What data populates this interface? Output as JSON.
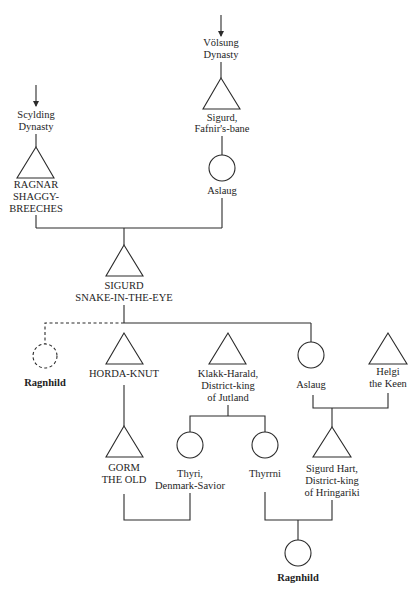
{
  "diagram": {
    "type": "genealogy-tree",
    "legend_implied": {
      "triangle": "male",
      "circle": "female",
      "dashed": "uncertain"
    },
    "ancestry": {
      "volsung": {
        "label_1": "Völsung",
        "label_2": "Dynasty"
      },
      "scylding": {
        "label_1": "Scylding",
        "label_2": "Dynasty"
      }
    },
    "people": {
      "sigurd_fafnir": {
        "label_1": "Sigurd,",
        "label_2": "Fafnir's-bane",
        "sex": "male"
      },
      "aslaug_1": {
        "label_1": "Aslaug",
        "sex": "female"
      },
      "ragnar": {
        "label_1": "RAGNAR",
        "label_2": "SHAGGY-",
        "label_3": "BREECHES",
        "sex": "male"
      },
      "sigurd_snake": {
        "label_1": "SIGURD",
        "label_2": "SNAKE-IN-THE-EYE",
        "sex": "male"
      },
      "ragnhild_1": {
        "label_1": "Ragnhild",
        "sex": "female",
        "uncertain": true
      },
      "horda_knut": {
        "label_1": "HORDA-KNUT",
        "sex": "male"
      },
      "klakk_harald": {
        "label_1": "Klakk-Harald,",
        "label_2": "District-king",
        "label_3": "of Jutland",
        "sex": "male"
      },
      "aslaug_2": {
        "label_1": "Aslaug",
        "sex": "female"
      },
      "helgi": {
        "label_1": "Helgi",
        "label_2": "the Keen",
        "sex": "male"
      },
      "gorm": {
        "label_1": "GORM",
        "label_2": "THE OLD",
        "sex": "male"
      },
      "thyri": {
        "label_1": "Thyri,",
        "label_2": "Denmark-Savior",
        "sex": "female"
      },
      "thyrrni": {
        "label_1": "Thyrrni",
        "sex": "female"
      },
      "sigurd_hart": {
        "label_1": "Sigurd Hart,",
        "label_2": "District-king",
        "label_3": "of Hringariki",
        "sex": "male"
      },
      "ragnhild_2": {
        "label_1": "Ragnhild",
        "sex": "female"
      }
    },
    "relations": [
      {
        "parents": [
          "ragnar",
          "aslaug_1"
        ],
        "children": [
          "sigurd_snake"
        ]
      },
      {
        "parents": [
          "sigurd_fafnir"
        ],
        "children": [
          "aslaug_1"
        ]
      },
      {
        "parents": [
          "sigurd_snake"
        ],
        "children": [
          "ragnhild_1",
          "horda_knut",
          "aslaug_2"
        ]
      },
      {
        "parents": [
          "horda_knut"
        ],
        "children": [
          "gorm"
        ]
      },
      {
        "parents": [
          "klakk_harald"
        ],
        "children": [
          "thyri",
          "thyrrni"
        ]
      },
      {
        "parents": [
          "aslaug_2",
          "helgi"
        ],
        "children": [
          "sigurd_hart"
        ]
      },
      {
        "parents": [
          "gorm",
          "thyri"
        ],
        "children": []
      },
      {
        "parents": [
          "thyrrni",
          "sigurd_hart"
        ],
        "children": [
          "ragnhild_2"
        ]
      }
    ]
  }
}
